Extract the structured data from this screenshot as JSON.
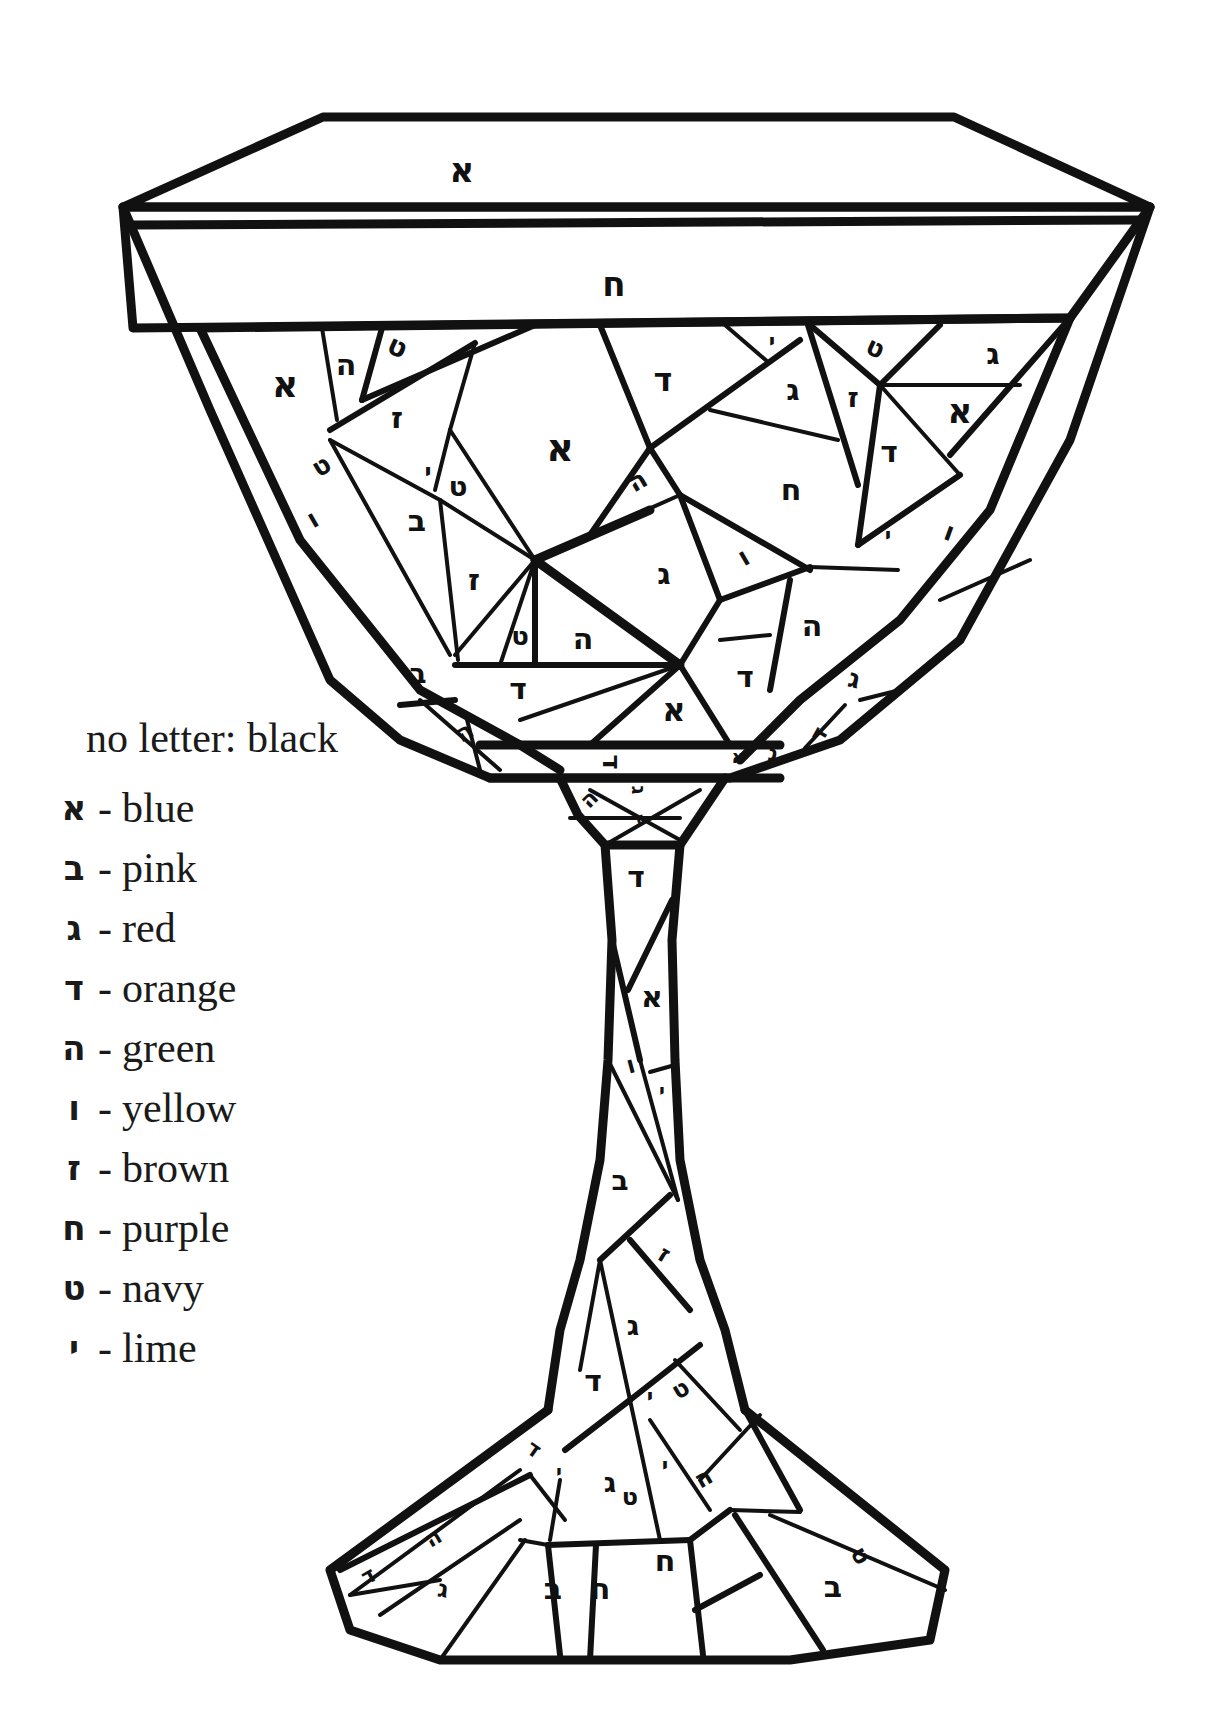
{
  "legend": {
    "title": "no letter: black",
    "items": [
      {
        "letter": "א",
        "dash": "-",
        "color": "blue",
        "hex": "#1f4fd1"
      },
      {
        "letter": "ב",
        "dash": "-",
        "color": "pink",
        "hex": "#f7a1c4"
      },
      {
        "letter": "ג",
        "dash": "-",
        "color": "red",
        "hex": "#d62828"
      },
      {
        "letter": "ד",
        "dash": "-",
        "color": "orange",
        "hex": "#f28c28"
      },
      {
        "letter": "ה",
        "dash": "-",
        "color": "green",
        "hex": "#2a9d3a"
      },
      {
        "letter": "ו",
        "dash": "-",
        "color": "yellow",
        "hex": "#f6d32d"
      },
      {
        "letter": "ז",
        "dash": "-",
        "color": "brown",
        "hex": "#7b4a22"
      },
      {
        "letter": "ח",
        "dash": "-",
        "color": "purple",
        "hex": "#7b2fbf"
      },
      {
        "letter": "ט",
        "dash": "-",
        "color": "navy",
        "hex": "#1b2a5c"
      },
      {
        "letter": "י",
        "dash": "-",
        "color": "lime",
        "hex": "#9be23a"
      }
    ]
  },
  "goblet": {
    "rim_labels": [
      {
        "letter": "א",
        "x": 462,
        "y": 172,
        "size": 34,
        "rot": 0
      },
      {
        "letter": "ח",
        "x": 614,
        "y": 286,
        "size": 34,
        "rot": 0
      }
    ],
    "bowl_labels": [
      {
        "letter": "א",
        "x": 285,
        "y": 387,
        "size": 36,
        "rot": 0
      },
      {
        "letter": "ה",
        "x": 346,
        "y": 366,
        "size": 30,
        "rot": 0
      },
      {
        "letter": "ט",
        "x": 397,
        "y": 348,
        "size": 28,
        "rot": 25
      },
      {
        "letter": "ז",
        "x": 397,
        "y": 419,
        "size": 30,
        "rot": 0
      },
      {
        "letter": "ט",
        "x": 322,
        "y": 467,
        "size": 26,
        "rot": -30
      },
      {
        "letter": "ו",
        "x": 313,
        "y": 520,
        "size": 26,
        "rot": -30
      },
      {
        "letter": "י",
        "x": 428,
        "y": 473,
        "size": 24,
        "rot": 0
      },
      {
        "letter": "ט",
        "x": 458,
        "y": 488,
        "size": 28,
        "rot": 0
      },
      {
        "letter": "ב",
        "x": 417,
        "y": 522,
        "size": 30,
        "rot": 0
      },
      {
        "letter": "ז",
        "x": 474,
        "y": 581,
        "size": 30,
        "rot": 0
      },
      {
        "letter": "א",
        "x": 560,
        "y": 450,
        "size": 38,
        "rot": 0
      },
      {
        "letter": "ד",
        "x": 663,
        "y": 382,
        "size": 32,
        "rot": 0
      },
      {
        "letter": "י",
        "x": 772,
        "y": 343,
        "size": 22,
        "rot": 0
      },
      {
        "letter": "ג",
        "x": 793,
        "y": 391,
        "size": 30,
        "rot": 0
      },
      {
        "letter": "ט",
        "x": 875,
        "y": 349,
        "size": 26,
        "rot": 25
      },
      {
        "letter": "ז",
        "x": 853,
        "y": 399,
        "size": 28,
        "rot": 0
      },
      {
        "letter": "ג",
        "x": 993,
        "y": 355,
        "size": 30,
        "rot": 0
      },
      {
        "letter": "א",
        "x": 960,
        "y": 413,
        "size": 34,
        "rot": 0
      },
      {
        "letter": "ד",
        "x": 889,
        "y": 453,
        "size": 30,
        "rot": 0
      },
      {
        "letter": "ה",
        "x": 638,
        "y": 482,
        "size": 26,
        "rot": -30
      },
      {
        "letter": "ח",
        "x": 791,
        "y": 491,
        "size": 30,
        "rot": 0
      },
      {
        "letter": "י",
        "x": 888,
        "y": 537,
        "size": 22,
        "rot": 0
      },
      {
        "letter": "ו",
        "x": 949,
        "y": 533,
        "size": 26,
        "rot": 20
      },
      {
        "letter": "ג",
        "x": 664,
        "y": 575,
        "size": 30,
        "rot": 0
      },
      {
        "letter": "ו",
        "x": 744,
        "y": 558,
        "size": 26,
        "rot": -30
      },
      {
        "letter": "ט",
        "x": 520,
        "y": 637,
        "size": 26,
        "rot": 0
      },
      {
        "letter": "ה",
        "x": 583,
        "y": 640,
        "size": 30,
        "rot": 0
      },
      {
        "letter": "ה",
        "x": 812,
        "y": 627,
        "size": 30,
        "rot": 0
      },
      {
        "letter": "ב",
        "x": 418,
        "y": 675,
        "size": 28,
        "rot": 0
      },
      {
        "letter": "ד",
        "x": 518,
        "y": 690,
        "size": 30,
        "rot": 0
      },
      {
        "letter": "ד",
        "x": 745,
        "y": 678,
        "size": 30,
        "rot": 0
      },
      {
        "letter": "א",
        "x": 674,
        "y": 712,
        "size": 32,
        "rot": 0
      },
      {
        "letter": "ג",
        "x": 854,
        "y": 680,
        "size": 26,
        "rot": 15
      },
      {
        "letter": "ה",
        "x": 465,
        "y": 733,
        "size": 24,
        "rot": -30
      },
      {
        "letter": "י",
        "x": 508,
        "y": 740,
        "size": 22,
        "rot": 0
      },
      {
        "letter": "ד",
        "x": 610,
        "y": 762,
        "size": 26,
        "rot": 90
      },
      {
        "letter": "א",
        "x": 738,
        "y": 758,
        "size": 18,
        "rot": 0
      },
      {
        "letter": "ג",
        "x": 773,
        "y": 755,
        "size": 22,
        "rot": 10
      },
      {
        "letter": "ד",
        "x": 820,
        "y": 735,
        "size": 22,
        "rot": -60
      }
    ],
    "stem_labels": [
      {
        "letter": "ה",
        "x": 590,
        "y": 800,
        "size": 22,
        "rot": -45
      },
      {
        "letter": "ג",
        "x": 637,
        "y": 790,
        "size": 20,
        "rot": 90
      },
      {
        "letter": "ג",
        "x": 640,
        "y": 820,
        "size": 18,
        "rot": 170
      },
      {
        "letter": "ד",
        "x": 636,
        "y": 878,
        "size": 30,
        "rot": 0
      },
      {
        "letter": "א",
        "x": 652,
        "y": 998,
        "size": 30,
        "rot": 0
      },
      {
        "letter": "ו",
        "x": 631,
        "y": 1066,
        "size": 24,
        "rot": -15
      },
      {
        "letter": "י",
        "x": 662,
        "y": 1092,
        "size": 20,
        "rot": 0
      },
      {
        "letter": "ב",
        "x": 620,
        "y": 1182,
        "size": 28,
        "rot": 0
      },
      {
        "letter": "ז",
        "x": 664,
        "y": 1255,
        "size": 24,
        "rot": 30
      },
      {
        "letter": "ג",
        "x": 633,
        "y": 1327,
        "size": 28,
        "rot": 0
      },
      {
        "letter": "ד",
        "x": 593,
        "y": 1382,
        "size": 30,
        "rot": 0
      },
      {
        "letter": "י",
        "x": 650,
        "y": 1398,
        "size": 22,
        "rot": 0
      },
      {
        "letter": "ט",
        "x": 681,
        "y": 1390,
        "size": 24,
        "rot": -30
      }
    ],
    "foot_labels": [
      {
        "letter": "ד",
        "x": 533,
        "y": 1450,
        "size": 22,
        "rot": 35
      },
      {
        "letter": "י",
        "x": 559,
        "y": 1473,
        "size": 20,
        "rot": 0
      },
      {
        "letter": "ג",
        "x": 610,
        "y": 1484,
        "size": 28,
        "rot": 0
      },
      {
        "letter": "ט",
        "x": 630,
        "y": 1498,
        "size": 24,
        "rot": 0
      },
      {
        "letter": "י",
        "x": 665,
        "y": 1467,
        "size": 22,
        "rot": 0
      },
      {
        "letter": "ה",
        "x": 704,
        "y": 1479,
        "size": 24,
        "rot": -30
      },
      {
        "letter": "ה",
        "x": 434,
        "y": 1539,
        "size": 22,
        "rot": -30
      },
      {
        "letter": "ד",
        "x": 369,
        "y": 1577,
        "size": 22,
        "rot": -30
      },
      {
        "letter": "ג",
        "x": 443,
        "y": 1590,
        "size": 24,
        "rot": 10
      },
      {
        "letter": "ב",
        "x": 553,
        "y": 1590,
        "size": 30,
        "rot": 0
      },
      {
        "letter": "ח",
        "x": 600,
        "y": 1590,
        "size": 30,
        "rot": 0
      },
      {
        "letter": "ח",
        "x": 665,
        "y": 1562,
        "size": 30,
        "rot": 0
      },
      {
        "letter": "ב",
        "x": 833,
        "y": 1588,
        "size": 30,
        "rot": 0
      },
      {
        "letter": "ט",
        "x": 860,
        "y": 1556,
        "size": 24,
        "rot": 60
      }
    ]
  }
}
